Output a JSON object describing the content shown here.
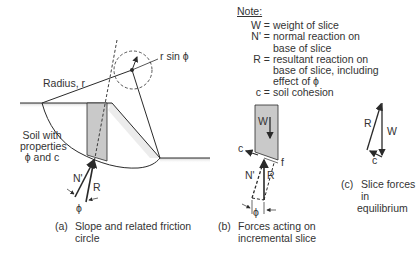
{
  "panel_a": {
    "radius_label": "Radius, r",
    "rsin_label": "r sin ϕ",
    "soil_label": [
      "Soil with",
      "properties",
      "ϕ and c"
    ],
    "n_label": "N'",
    "r_label": "R",
    "phi_label": "ϕ",
    "caption_prefix": "(a)",
    "caption_lines": [
      "Slope and related friction",
      "circle"
    ]
  },
  "panel_b": {
    "w_label": "W",
    "c_label": "c",
    "f_label": "f",
    "n_label": "N'",
    "r_label": "R",
    "phi_label": "ϕ",
    "caption_prefix": "(b)",
    "caption_lines": [
      "Forces acting on",
      "incremental slice"
    ]
  },
  "panel_c": {
    "r_label": "R",
    "w_label": "W",
    "c_label": "c",
    "caption_prefix": "(c)",
    "caption_lines": [
      "Slice forces in",
      "equilibrium"
    ]
  },
  "note": {
    "header": "Note:",
    "items": [
      {
        "key": "W =",
        "lines": [
          "weight of slice"
        ]
      },
      {
        "key": "N' =",
        "lines": [
          "normal reaction on",
          "base of slice"
        ]
      },
      {
        "key": "R =",
        "lines": [
          "resultant reaction on",
          "base of slice, including",
          "effect of ϕ"
        ]
      },
      {
        "key": "c =",
        "lines": [
          "soil cohesion"
        ]
      }
    ]
  },
  "colors": {
    "line": "#2a2a2a",
    "slice_fill": "#c9c9c9",
    "ground_shade": "#d8d8d8"
  }
}
